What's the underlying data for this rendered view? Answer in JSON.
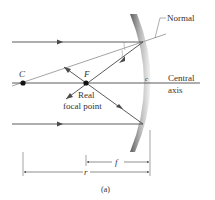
{
  "labels": {
    "normal": "Normal",
    "center_point": "C",
    "focal_point": "F",
    "vertex": "c",
    "central_axis_line1": "Central",
    "central_axis_line2": "axis",
    "real_focal_line1": "Real",
    "real_focal_line2": "focal point",
    "focal_length": "f",
    "radius": "r",
    "caption": "(a)"
  },
  "colors": {
    "ray": "#4a4a4a",
    "normal_line": "#9a9a9a",
    "mirror_dark": "#6e6e6e",
    "mirror_light": "#e8e8e8",
    "point": "#111111"
  }
}
